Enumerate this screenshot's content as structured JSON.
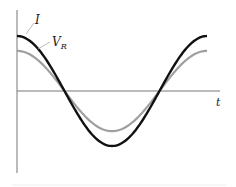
{
  "chart_data": {
    "type": "line",
    "title": "",
    "xlabel": "t",
    "ylabel": "",
    "grid": false,
    "legend": "inline leader-line labels",
    "series": [
      {
        "name": "I",
        "label_main": "I",
        "label_sub": "",
        "color": "#111111",
        "amplitude": 1.0,
        "shape": "cosine, one full period"
      },
      {
        "name": "V_R",
        "label_main": "V",
        "label_sub": "R",
        "color": "#a0a0a0",
        "amplitude": 0.73,
        "shape": "cosine, one full period, in phase with I"
      }
    ],
    "x": [
      0,
      0.25,
      0.5,
      0.75,
      1.0
    ],
    "values_I": [
      1.0,
      0.0,
      -1.0,
      0.0,
      1.0
    ],
    "values_VR": [
      0.73,
      0.0,
      -0.73,
      0.0,
      0.73
    ]
  },
  "labels": {
    "I": "I",
    "VR_main": "V",
    "VR_sub": "R",
    "t_axis": "t"
  },
  "colors": {
    "current": "#111111",
    "voltage": "#a0a0a0",
    "axis": "#777777"
  }
}
